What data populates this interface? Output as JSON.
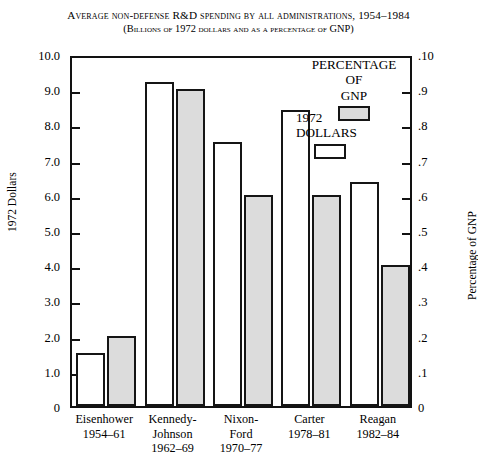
{
  "chart_data": {
    "type": "bar",
    "title": "Average non-defense R&D spending by all administrations, 1954–1984",
    "subtitle": "(Billions of 1972 dollars and as a percentage of GNP)",
    "categories": [
      "Eisenhower",
      "Kennedy-Johnson",
      "Nixon-Ford",
      "Carter",
      "Reagan"
    ],
    "category_lines": [
      [
        "Eisenhower",
        "1954–61"
      ],
      [
        "Kennedy-",
        "Johnson",
        "1962–69"
      ],
      [
        "Nixon-",
        "Ford",
        "1970–77"
      ],
      [
        "Carter",
        "1978–81"
      ],
      [
        "Reagan",
        "1982–84"
      ]
    ],
    "series": [
      {
        "name": "1972 DOLLARS",
        "axis": "left",
        "color": "#ffffff",
        "values": [
          1.5,
          9.2,
          7.5,
          8.4,
          6.35
        ]
      },
      {
        "name": "PERCENTAGE OF GNP",
        "axis": "right",
        "color": "#dcdcdc",
        "values": [
          0.02,
          0.09,
          0.06,
          0.06,
          0.04
        ]
      }
    ],
    "xlabel": "",
    "ylabel": "1972 Dollars",
    "ylabel_right": "Percentage of GNP",
    "ylim": [
      0,
      10
    ],
    "ylim_right": [
      0,
      0.1
    ],
    "yticks": [
      "0",
      "1.0",
      "2.0",
      "3.0",
      "4.0",
      "5.0",
      "6.0",
      "7.0",
      "8.0",
      "9.0",
      "10.0"
    ],
    "ytick_values": [
      0,
      1,
      2,
      3,
      4,
      5,
      6,
      7,
      8,
      9,
      10
    ],
    "yticks_right": [
      "0",
      ".1",
      ".2",
      ".3",
      ".4",
      ".5",
      ".6",
      ".7",
      ".8",
      ".9",
      ".10"
    ],
    "grid": false,
    "legend_position": "top-right"
  },
  "legend": {
    "percentage": {
      "line1": "PERCENTAGE",
      "line2": "OF",
      "line3": "GNP"
    },
    "dollars": {
      "line1": "1972",
      "line2": "DOLLARS"
    }
  }
}
